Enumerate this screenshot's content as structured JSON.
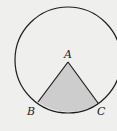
{
  "diagram": {
    "type": "circle-sector",
    "background": "#efefed",
    "stroke_color": "#1e1e1e",
    "fill_color": "#cdcdcd",
    "circle": {
      "cx": 68,
      "cy": 60,
      "r": 53
    },
    "points": {
      "A": {
        "label": "A",
        "x": 68,
        "y": 62
      },
      "B": {
        "label": "B",
        "x": 38,
        "y": 102
      },
      "C": {
        "label": "C",
        "x": 98,
        "y": 103
      }
    },
    "shaded_region": "sector ABC"
  }
}
